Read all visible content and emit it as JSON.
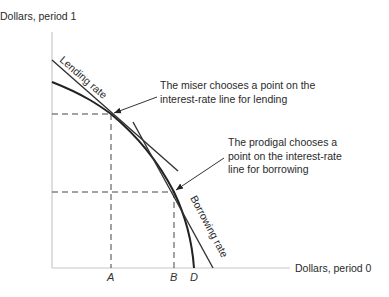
{
  "diagram": {
    "type": "intertemporal-consumption",
    "y_axis_label": "Dollars, period 1",
    "x_axis_label": "Dollars, period 0",
    "lines": {
      "lending": "Lending rate",
      "borrowing": "Borrowing rate"
    },
    "annotations": {
      "miser": [
        "The miser chooses a point on the",
        "interest-rate line for lending"
      ],
      "prodigal": [
        "The prodigal chooses a",
        "point on the interest-rate",
        "line for borrowing"
      ]
    },
    "x_ticks": [
      "A",
      "B",
      "D"
    ],
    "colors": {
      "axis": "#c8c8c8",
      "curve": "#222222",
      "dash": "#444444"
    }
  }
}
